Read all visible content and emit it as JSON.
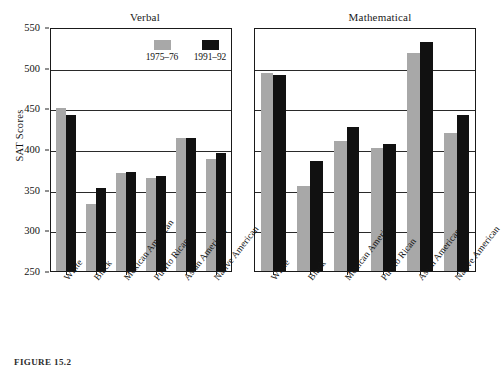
{
  "figure": {
    "caption": "FIGURE 15.2",
    "y_axis_title": "SAT Scores"
  },
  "legend": {
    "position": "top-right-of-left-panel",
    "entries": [
      {
        "label": "1975–76",
        "color": "#a8a8a8"
      },
      {
        "label": "1991–92",
        "color": "#111111"
      }
    ]
  },
  "colors": {
    "series_1975": "#a8a8a8",
    "series_1991": "#111111",
    "axis": "#1a1a1a",
    "grid": "#2a2a2a",
    "background": "#ffffff"
  },
  "axis": {
    "yticks": [
      250,
      300,
      350,
      400,
      450,
      500,
      550
    ],
    "ymin": 250,
    "ymax": 550,
    "grid": true
  },
  "chart_data": [
    {
      "type": "bar",
      "title": "Verbal",
      "xlabel": "",
      "ylabel": "SAT Scores",
      "ylim": [
        250,
        550
      ],
      "yticks": [
        250,
        300,
        350,
        400,
        450,
        500,
        550
      ],
      "grid": true,
      "legend_position": "upper right",
      "categories": [
        "White",
        "Black",
        "Mexican American",
        "Puerto Rican",
        "Asian American",
        "Native American"
      ],
      "series": [
        {
          "name": "1975–76",
          "color": "#a8a8a8",
          "values": [
            451,
            332,
            371,
            364,
            414,
            388
          ]
        },
        {
          "name": "1991–92",
          "color": "#111111",
          "values": [
            442,
            352,
            372,
            367,
            413,
            395
          ]
        }
      ]
    },
    {
      "type": "bar",
      "title": "Mathematical",
      "xlabel": "",
      "ylabel": "",
      "ylim": [
        250,
        550
      ],
      "yticks": [
        250,
        300,
        350,
        400,
        450,
        500,
        550
      ],
      "grid": true,
      "legend_position": "none",
      "categories": [
        "White",
        "Black",
        "Mexican American",
        "Puerto Rican",
        "Asian American",
        "Native American"
      ],
      "series": [
        {
          "name": "1975–76",
          "color": "#a8a8a8",
          "values": [
            493,
            354,
            410,
            401,
            518,
            420
          ]
        },
        {
          "name": "1991–92",
          "color": "#111111",
          "values": [
            491,
            385,
            427,
            406,
            532,
            442
          ]
        }
      ]
    }
  ]
}
